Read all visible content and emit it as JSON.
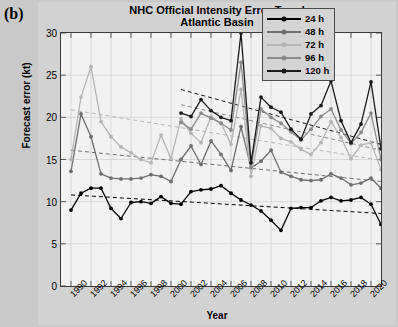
{
  "panel": {
    "label": "(b)"
  },
  "chart_data": {
    "type": "line",
    "title": "NHC Official Intensity Error Trend",
    "subtitle": "Atlantic Basin",
    "xlabel": "Year",
    "ylabel": "Forecast error (kt)",
    "xlim": [
      1989,
      2021
    ],
    "ylim": [
      0,
      30
    ],
    "yticks": [
      0,
      5,
      10,
      15,
      20,
      25,
      30
    ],
    "xticks": [
      1990,
      1992,
      1994,
      1996,
      1998,
      2000,
      2002,
      2004,
      2006,
      2008,
      2010,
      2012,
      2014,
      2016,
      2018,
      2020
    ],
    "grid": true,
    "legend_position": "top-right",
    "x": [
      1990,
      1991,
      1992,
      1993,
      1994,
      1995,
      1996,
      1997,
      1998,
      1999,
      2000,
      2001,
      2002,
      2003,
      2004,
      2005,
      2006,
      2007,
      2008,
      2009,
      2010,
      2011,
      2012,
      2013,
      2014,
      2015,
      2016,
      2017,
      2018,
      2019,
      2020,
      2021
    ],
    "series": [
      {
        "name": "24 h",
        "color": "#000000",
        "values": [
          9.0,
          11.0,
          11.6,
          11.6,
          9.2,
          8.0,
          9.9,
          10.0,
          9.8,
          10.6,
          9.8,
          9.7,
          11.2,
          11.4,
          11.5,
          11.9,
          11.0,
          10.2,
          9.6,
          8.9,
          7.8,
          6.6,
          9.2,
          9.3,
          9.3,
          10.1,
          10.5,
          10.1,
          10.2,
          10.5,
          9.7,
          7.3
        ],
        "trend": {
          "start": 10.8,
          "end": 8.6
        }
      },
      {
        "name": "48 h",
        "color": "#6e6e6e",
        "values": [
          13.6,
          20.4,
          17.7,
          13.3,
          12.8,
          12.7,
          12.7,
          12.8,
          13.2,
          13.0,
          12.4,
          15.0,
          16.6,
          14.4,
          17.2,
          15.6,
          13.7,
          18.9,
          14.0,
          14.8,
          16.1,
          13.5,
          13.0,
          12.6,
          12.5,
          12.6,
          13.3,
          12.8,
          12.0,
          12.2,
          12.8,
          11.6
        ],
        "trend": {
          "start": 16.1,
          "end": 12.4
        }
      },
      {
        "name": "72 h",
        "color": "#b4b4b4",
        "values": [
          15.0,
          22.4,
          26.0,
          19.5,
          17.7,
          16.5,
          15.8,
          15.0,
          14.6,
          17.9,
          15.1,
          19.8,
          18.1,
          17.0,
          20.1,
          19.3,
          16.8,
          23.3,
          13.0,
          19.0,
          18.7,
          17.5,
          17.1,
          16.2,
          15.6,
          17.0,
          19.5,
          17.6,
          15.1,
          16.7,
          17.0,
          13.8
        ],
        "trend": {
          "start": 20.9,
          "end": 14.9
        }
      },
      {
        "name": "96 h",
        "color": "#8a8a8a",
        "values": [
          null,
          null,
          null,
          null,
          null,
          null,
          null,
          null,
          null,
          null,
          null,
          19.4,
          18.6,
          20.5,
          19.9,
          19.3,
          18.5,
          26.5,
          14.1,
          21.0,
          20.0,
          19.3,
          18.3,
          17.3,
          18.6,
          20.1,
          21.0,
          18.5,
          16.9,
          18.2,
          20.5,
          15.0
        ],
        "trend": {
          "start": 21.5,
          "end": 16.1
        }
      },
      {
        "name": "120 h",
        "color": "#1a1a1a",
        "values": [
          null,
          null,
          null,
          null,
          null,
          null,
          null,
          null,
          null,
          null,
          null,
          20.5,
          20.1,
          22.1,
          20.8,
          20.0,
          19.6,
          30.0,
          14.6,
          22.4,
          21.2,
          20.6,
          18.6,
          17.4,
          20.4,
          21.4,
          24.3,
          19.6,
          17.0,
          19.2,
          24.2,
          16.3
        ],
        "trend": {
          "start": 23.3,
          "end": 16.8
        }
      }
    ]
  }
}
